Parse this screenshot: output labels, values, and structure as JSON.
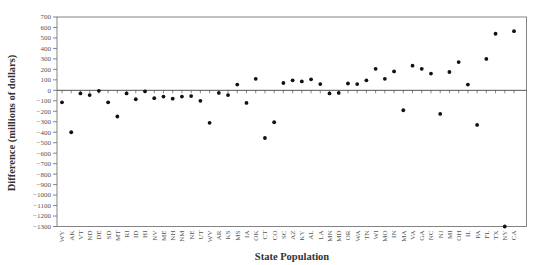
{
  "chart_data": {
    "type": "scatter",
    "title": "",
    "xlabel": "State Population",
    "ylabel": "Difference (millions of dollars)",
    "ylim": [
      -1300,
      700
    ],
    "yticks": [
      700,
      600,
      500,
      400,
      300,
      200,
      100,
      0,
      -100,
      -200,
      -300,
      -400,
      -500,
      -600,
      -700,
      -800,
      -900,
      -1000,
      -1100,
      -1200,
      -1300
    ],
    "grid": false,
    "legend": "none",
    "categories": [
      "WY",
      "AK",
      "VT",
      "ND",
      "DE",
      "SD",
      "MT",
      "RI",
      "ID",
      "HI",
      "NV",
      "ME",
      "NH",
      "NM",
      "NE",
      "UT",
      "WV",
      "AR",
      "KS",
      "MS",
      "IA",
      "OK",
      "CT",
      "CO",
      "SC",
      "AZ",
      "KY",
      "AL",
      "LA",
      "MN",
      "MD",
      "OR",
      "WA",
      "TN",
      "WI",
      "MO",
      "IN",
      "MA",
      "VA",
      "GA",
      "NC",
      "NJ",
      "MI",
      "OH",
      "IL",
      "PA",
      "FL",
      "TX",
      "NY",
      "CA"
    ],
    "values": [
      -115,
      -400,
      -30,
      -45,
      -5,
      -115,
      -250,
      -30,
      -85,
      -10,
      -75,
      -60,
      -80,
      -60,
      -55,
      -100,
      -310,
      -25,
      -45,
      55,
      -120,
      110,
      -455,
      -305,
      70,
      95,
      85,
      105,
      60,
      -30,
      -25,
      65,
      60,
      95,
      205,
      110,
      180,
      -190,
      235,
      205,
      160,
      -225,
      175,
      270,
      55,
      -330,
      300,
      540,
      -1300,
      565
    ]
  }
}
